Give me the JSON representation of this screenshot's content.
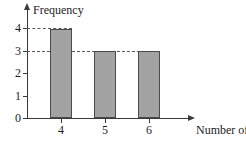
{
  "chart_data": {
    "type": "bar",
    "title": "",
    "subtitle": "",
    "xlabel": "Number of cards",
    "ylabel": "Frequency",
    "categories": [
      "4",
      "5",
      "6"
    ],
    "values": [
      4,
      3,
      3
    ],
    "series": [
      {
        "name": "Frequency",
        "values": [
          4,
          3,
          3
        ]
      }
    ],
    "xlim": [
      3.3,
      6.9
    ],
    "ylim": [
      0,
      4.45
    ],
    "y_ticks": [
      0,
      1,
      2,
      3,
      4
    ],
    "y_tick_labels": [
      "0",
      "1",
      "2",
      "3",
      "4"
    ],
    "x_ticks": [
      "4",
      "5",
      "6"
    ],
    "x_tick_labels": [
      "4",
      "5",
      "6"
    ],
    "grid": false,
    "legend": "none",
    "annotations": [
      {
        "name": "guide-line-4",
        "type": "dashed-horizontal-guide",
        "value": 4,
        "from_axis": true,
        "extends_to_category": "4"
      },
      {
        "name": "guide-line-3",
        "type": "dashed-horizontal-guide",
        "value": 3,
        "from_axis": true,
        "extends_to_category": "6"
      }
    ],
    "colors": {
      "bar_fill": "#a3a3a3",
      "bar_stroke": "#4a4a4a",
      "axis": "#3a3a3a",
      "guide_line": "#5a5a5a",
      "text": "#1d1d1d",
      "background": "#ffffff"
    }
  }
}
